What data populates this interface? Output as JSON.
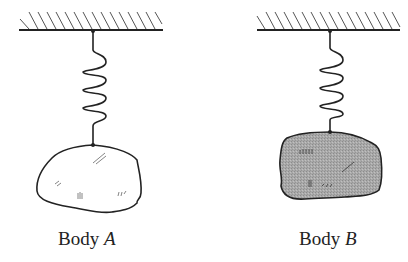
{
  "figure": {
    "bodies": [
      {
        "id": "A",
        "label_prefix": "Body",
        "label_letter": "A",
        "fill": "#ffffff",
        "ceiling": {
          "x1": 19,
          "x2": 163,
          "y": 30
        },
        "attach_x": 93,
        "spring": {
          "top": 30,
          "bottom": 145
        }
      },
      {
        "id": "B",
        "label_prefix": "Body",
        "label_letter": "B",
        "fill": "#a8a8a8",
        "ceiling": {
          "x1": 257,
          "x2": 400,
          "y": 30
        },
        "attach_x": 330,
        "spring": {
          "top": 30,
          "bottom": 132
        }
      }
    ],
    "stroke_color": "#222222"
  }
}
